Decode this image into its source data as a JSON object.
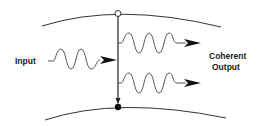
{
  "diagram": {
    "input_label": "Input",
    "output_label_line1": "Coherent",
    "output_label_line2": "Output",
    "colors": {
      "stroke": "#333333",
      "background": "#ffffff"
    }
  }
}
